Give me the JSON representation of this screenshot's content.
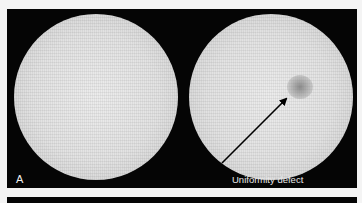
{
  "figure": {
    "panel_label": "A",
    "annotation": "Uniformity defect",
    "images": [
      {
        "name": "uniform-flood-image",
        "description": "uniform circular flood field"
      },
      {
        "name": "defect-flood-image",
        "description": "circular flood field with a cold spot"
      }
    ],
    "colors": {
      "background": "#f4f4f4",
      "panel": "#050505",
      "field": "#e2e2e2",
      "defect": "#8a8a8a",
      "arrow": "#000000",
      "label": "#f0f0f0"
    }
  }
}
